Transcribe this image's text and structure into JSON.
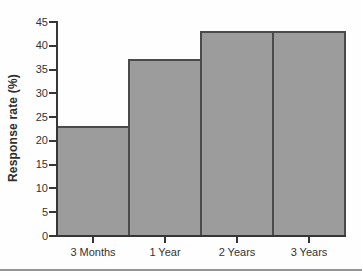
{
  "chart_data": {
    "type": "bar",
    "title": "",
    "xlabel": "",
    "ylabel": "Response rate (%)",
    "categories": [
      "3 Months",
      "1 Year",
      "2 Years",
      "3 Years"
    ],
    "values": [
      23,
      37,
      43,
      43
    ],
    "ylim": [
      0,
      45
    ],
    "yticks": [
      0,
      5,
      10,
      15,
      20,
      25,
      30,
      35,
      40,
      45
    ],
    "grid": false,
    "legend": "none",
    "bar_fill": "#9c9c9c",
    "bar_border": "#4a4a4a",
    "axis_color": "#363636",
    "tick_text_color": "#333333",
    "background": "#fefefe",
    "divider_color": "#949494"
  }
}
